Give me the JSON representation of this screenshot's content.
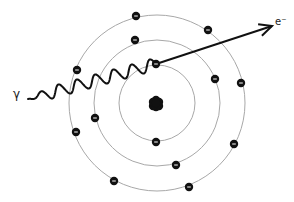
{
  "diagram": {
    "labels": {
      "photon": "γ",
      "ejected_electron": "e⁻"
    },
    "colors": {
      "orbit": "#a8a8a8",
      "electron": "#111111",
      "nucleus": "#111111",
      "photon_wave": "#111111",
      "arrow": "#111111"
    },
    "nucleus": {
      "cx": 156,
      "cy": 103,
      "r": 8
    },
    "orbits": [
      {
        "name": "inner-shell",
        "cx": 157,
        "cy": 103,
        "r": 38
      },
      {
        "name": "middle-shell",
        "cx": 157,
        "cy": 103,
        "r": 63
      },
      {
        "name": "outer-shell",
        "cx": 157,
        "cy": 103,
        "r": 88
      }
    ],
    "electrons": [
      {
        "shell": "inner",
        "x": 156,
        "y": 64,
        "role": "struck"
      },
      {
        "shell": "inner",
        "x": 156,
        "y": 142
      },
      {
        "shell": "middle",
        "x": 135,
        "y": 40
      },
      {
        "shell": "middle",
        "x": 215,
        "y": 79
      },
      {
        "shell": "middle",
        "x": 176,
        "y": 165
      },
      {
        "shell": "middle",
        "x": 95,
        "y": 118
      },
      {
        "shell": "outer",
        "x": 136,
        "y": 16
      },
      {
        "shell": "outer",
        "x": 208,
        "y": 30
      },
      {
        "shell": "outer",
        "x": 241,
        "y": 83
      },
      {
        "shell": "outer",
        "x": 234,
        "y": 144
      },
      {
        "shell": "outer",
        "x": 189,
        "y": 187
      },
      {
        "shell": "outer",
        "x": 114,
        "y": 181
      },
      {
        "shell": "outer",
        "x": 76,
        "y": 132
      },
      {
        "shell": "outer",
        "x": 77,
        "y": 70
      }
    ],
    "photon_wave": {
      "x1": 28,
      "y1": 99,
      "x2": 156,
      "y2": 64,
      "cycles": 7,
      "amplitude": 6
    },
    "ejection_arrow": {
      "x1": 156,
      "y1": 64,
      "x2": 272,
      "y2": 26
    }
  }
}
